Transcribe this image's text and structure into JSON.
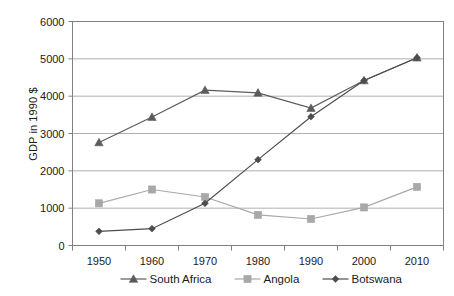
{
  "chart_data": {
    "type": "line",
    "title": "",
    "xlabel": "",
    "ylabel": "GDP in 1990 $",
    "categories": [
      "1950",
      "1960",
      "1970",
      "1980",
      "1990",
      "2000",
      "2010"
    ],
    "x": [
      1950,
      1960,
      1970,
      1980,
      1990,
      2000,
      2010
    ],
    "ylim": [
      0,
      6000
    ],
    "xlim": [
      1945,
      2015
    ],
    "ytick_labels": [
      "0",
      "1000",
      "2000",
      "3000",
      "4000",
      "5000",
      "6000"
    ],
    "yticks": [
      0,
      1000,
      2000,
      3000,
      4000,
      5000,
      6000
    ],
    "grid": "horizontal",
    "legend_position": "bottom",
    "series": [
      {
        "name": "South Africa",
        "marker": "triangle",
        "color": "#5c5c5c",
        "values": [
          2760,
          3440,
          4160,
          4090,
          3680,
          4420,
          5030
        ]
      },
      {
        "name": "Angola",
        "marker": "square",
        "color": "#a8a8a8",
        "values": [
          1130,
          1500,
          1300,
          820,
          710,
          1020,
          1570
        ]
      },
      {
        "name": "Botswana",
        "marker": "diamond",
        "color": "#4d4d4d",
        "values": [
          380,
          450,
          1130,
          2300,
          3450,
          4420,
          5030
        ]
      }
    ]
  },
  "legend": {
    "items": [
      {
        "label": "South Africa"
      },
      {
        "label": "Angola"
      },
      {
        "label": "Botswana"
      }
    ]
  }
}
